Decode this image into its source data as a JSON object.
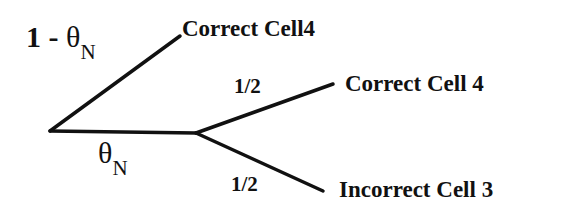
{
  "diagram": {
    "type": "probability-tree",
    "branches": [
      {
        "id": "upper",
        "prob_prefix": "1 - ",
        "prob_symbol": "θ",
        "prob_subscript": "N",
        "outcome": "Correct Cell4"
      },
      {
        "id": "lower",
        "prob_prefix": "",
        "prob_symbol": "θ",
        "prob_subscript": "N",
        "children": [
          {
            "id": "lower-upper",
            "prob": "1/2",
            "outcome": "Correct Cell 4"
          },
          {
            "id": "lower-lower",
            "prob": "1/2",
            "outcome": "Incorrect Cell 3"
          }
        ]
      }
    ],
    "line_color": "#111111"
  }
}
